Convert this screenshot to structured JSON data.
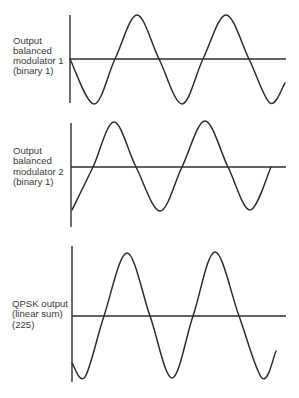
{
  "colors": {
    "background": "#ffffff",
    "line": "#2e2e2e",
    "text": "#3a3a3a"
  },
  "panels": [
    {
      "id": "modulator-1",
      "label_lines": [
        "Output",
        "balanced",
        "modulator 1",
        "(binary 1)"
      ],
      "label_x": 13,
      "label_y": [
        44,
        54,
        64,
        74
      ],
      "axes": {
        "vx": 70,
        "vy_top": 15,
        "vy_bottom": 103,
        "hy": 59,
        "hx_end": 286
      },
      "wave": {
        "description": "sine wave starting at zero going negative",
        "points": [
          [
            70,
            59
          ],
          [
            94,
            104
          ],
          [
            115,
            59
          ],
          [
            137,
            15
          ],
          [
            159,
            59
          ],
          [
            182,
            104
          ],
          [
            203,
            59
          ],
          [
            226,
            15
          ],
          [
            249,
            59
          ],
          [
            270,
            103
          ],
          [
            285,
            83
          ]
        ]
      }
    },
    {
      "id": "modulator-2",
      "label_lines": [
        "Output",
        "balanced",
        "modulator 2",
        "(binary 1)"
      ],
      "label_x": 13,
      "label_y": [
        154,
        164,
        175,
        185
      ],
      "axes": {
        "vx": 71,
        "vy_top": 123,
        "vy_bottom": 227,
        "hy": 167,
        "hx_end": 286
      },
      "wave": {
        "description": "wave starting at minimum (90 degree shifted)",
        "points": [
          [
            72,
            210
          ],
          [
            93,
            167
          ],
          [
            114,
            122
          ],
          [
            136,
            167
          ],
          [
            160,
            211
          ],
          [
            182,
            167
          ],
          [
            205,
            121
          ],
          [
            228,
            167
          ],
          [
            250,
            210
          ],
          [
            271,
            167
          ]
        ]
      }
    },
    {
      "id": "qpsk-output",
      "label_lines": [
        "QPSK output",
        "(linear sum)",
        "(225)"
      ],
      "label_x": 12,
      "label_y": [
        307,
        317,
        328
      ],
      "axes": {
        "vx": 72,
        "vy_top": 246,
        "vy_bottom": 382,
        "hy": 316,
        "hx_end": 286
      },
      "wave": {
        "description": "summed sine wave with 225 degree phase",
        "points": [
          [
            72,
            363
          ],
          [
            85,
            377
          ],
          [
            104,
            316
          ],
          [
            127,
            253
          ],
          [
            150,
            316
          ],
          [
            172,
            378
          ],
          [
            193,
            316
          ],
          [
            215,
            252
          ],
          [
            239,
            316
          ],
          [
            262,
            378
          ],
          [
            276,
            351
          ]
        ]
      }
    }
  ]
}
